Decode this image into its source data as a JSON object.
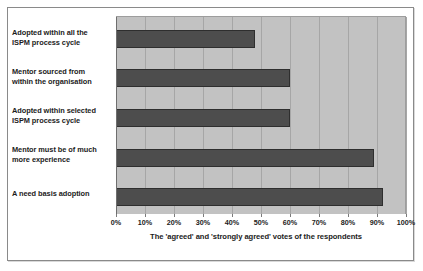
{
  "chart_data": {
    "type": "bar",
    "orientation": "horizontal",
    "title": "",
    "xlabel": "The 'agreed' and 'strongly agreed' votes of the respondents",
    "ylabel": "",
    "categories": [
      "Adopted within all the ISPM process cycle",
      "Mentor sourced from within the organisation",
      "Adopted within selected ISPM process cycle",
      "Mentor must be of much more experience",
      "A need basis adoption"
    ],
    "values": [
      48,
      60,
      60,
      89,
      92
    ],
    "xlim": [
      0,
      100
    ],
    "xticks": [
      0,
      10,
      20,
      30,
      40,
      50,
      60,
      70,
      80,
      90,
      100
    ],
    "xtick_labels": [
      "0%",
      "10%",
      "20%",
      "30%",
      "40%",
      "50%",
      "60%",
      "70%",
      "80%",
      "90%",
      "100%"
    ],
    "grid": true,
    "legend": false,
    "colors": {
      "bar_fill": "#4d4d4d",
      "bar_edge": "#2e2e2e",
      "plot_background": "#c2c2c2",
      "gridline": "#a6a6a6",
      "figure_background": "#ffffff",
      "frame_border": "#8a8a8a",
      "text": "#1b1b1b"
    }
  },
  "category_labels": [
    {
      "line1": "Adopted within all the",
      "line2": "ISPM process cycle"
    },
    {
      "line1": "Mentor sourced from",
      "line2": "within the organisation"
    },
    {
      "line1": "Adopted within selected",
      "line2": "ISPM process cycle"
    },
    {
      "line1": "Mentor must be of much",
      "line2": "more experience"
    },
    {
      "line1": "A need basis adoption",
      "line2": ""
    }
  ]
}
